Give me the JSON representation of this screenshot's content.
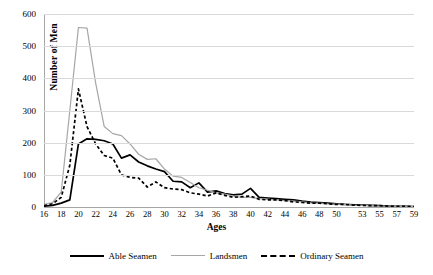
{
  "chart_data": {
    "type": "line",
    "title": "",
    "xlabel": "Ages",
    "ylabel": "Number of Men",
    "ylim": [
      0,
      600
    ],
    "ytick_values": [
      0,
      100,
      200,
      300,
      400,
      500,
      600
    ],
    "grid": true,
    "legend_position": "bottom",
    "x": [
      16,
      17,
      18,
      19,
      20,
      21,
      22,
      23,
      24,
      25,
      26,
      27,
      28,
      29,
      30,
      31,
      32,
      33,
      34,
      35,
      36,
      37,
      38,
      39,
      40,
      41,
      42,
      43,
      44,
      45,
      46,
      47,
      48,
      49,
      50,
      51,
      52,
      53,
      54,
      55,
      56,
      57,
      58,
      59
    ],
    "categories": [
      "16",
      "17",
      "18",
      "19",
      "20",
      "21",
      "22",
      "23",
      "24",
      "25",
      "26",
      "27",
      "28",
      "29",
      "30",
      "31",
      "32",
      "33",
      "34",
      "35",
      "36",
      "37",
      "38",
      "39",
      "40",
      "41",
      "42",
      "43",
      "44",
      "45",
      "46",
      "47",
      "48",
      "49",
      "50",
      "51",
      "52",
      "53",
      "54",
      "55",
      "56",
      "57",
      "58",
      "59"
    ],
    "xtick_labels": [
      "16",
      "18",
      "20",
      "22",
      "24",
      "26",
      "28",
      "30",
      "32",
      "34",
      "36",
      "38",
      "40",
      "42",
      "44",
      "46",
      "48",
      "50",
      "53",
      "55",
      "57",
      "59"
    ],
    "series": [
      {
        "name": "Able Seamen",
        "color": "#000000",
        "style": "solid",
        "values": [
          3,
          5,
          12,
          22,
          196,
          212,
          210,
          206,
          196,
          152,
          162,
          140,
          128,
          118,
          110,
          80,
          78,
          60,
          75,
          46,
          50,
          42,
          38,
          40,
          58,
          30,
          28,
          26,
          24,
          22,
          18,
          15,
          14,
          12,
          10,
          8,
          7,
          6,
          5,
          4,
          3,
          2,
          2,
          1
        ]
      },
      {
        "name": "Landsmen",
        "color": "#a6a6a6",
        "style": "solid",
        "values": [
          8,
          14,
          46,
          300,
          558,
          556,
          386,
          250,
          228,
          222,
          196,
          164,
          148,
          150,
          118,
          96,
          92,
          76,
          60,
          52,
          44,
          40,
          34,
          30,
          30,
          26,
          24,
          22,
          20,
          18,
          16,
          13,
          12,
          10,
          9,
          8,
          6,
          5,
          4,
          3,
          3,
          2,
          1,
          1
        ]
      },
      {
        "name": "Ordinary Seamen",
        "color": "#000000",
        "style": "dashed",
        "values": [
          4,
          10,
          30,
          130,
          367,
          250,
          196,
          160,
          152,
          100,
          92,
          90,
          62,
          78,
          60,
          56,
          54,
          44,
          40,
          34,
          44,
          36,
          30,
          32,
          34,
          24,
          22,
          22,
          20,
          16,
          14,
          12,
          12,
          10,
          8,
          8,
          6,
          5,
          4,
          4,
          3,
          2,
          2,
          1
        ]
      }
    ]
  },
  "axis": {
    "x_title": "Ages",
    "y_title": "Number of Men"
  },
  "legend": {
    "items": [
      {
        "label": "Able Seamen"
      },
      {
        "label": "Landsmen"
      },
      {
        "label": "Ordinary Seamen"
      }
    ]
  }
}
